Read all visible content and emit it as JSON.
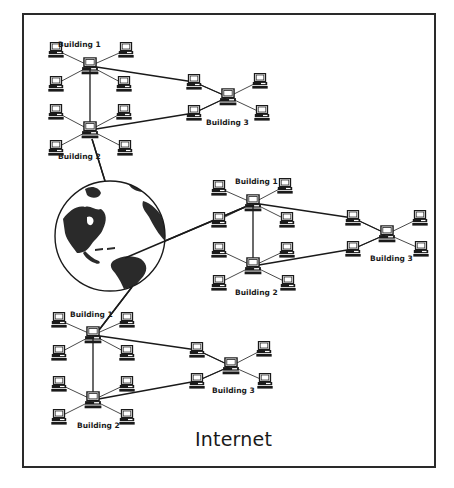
{
  "diagram": {
    "title": "Internet",
    "colors": {
      "ink": "#1a1a1a",
      "background": "#ffffff"
    },
    "globe": {
      "icon": "globe-icon",
      "cx": 110,
      "cy": 236,
      "r": 55
    },
    "networks": [
      {
        "id": "network-top-left",
        "buildings": [
          {
            "label": "Building 1",
            "hub": [
              90,
              66
            ],
            "label_pos": [
              58,
              47
            ],
            "satellites": [
              [
                56,
                50
              ],
              [
                126,
                50
              ],
              [
                56,
                84
              ],
              [
                124,
                84
              ]
            ]
          },
          {
            "label": "Building 2",
            "hub": [
              90,
              130
            ],
            "label_pos": [
              58,
              159
            ],
            "satellites": [
              [
                56,
                112
              ],
              [
                124,
                112
              ],
              [
                56,
                148
              ],
              [
                125,
                148
              ]
            ]
          },
          {
            "label": "Building 3",
            "hub": [
              228,
              97
            ],
            "label_pos": [
              206,
              125
            ],
            "satellites": [
              [
                194,
                82
              ],
              [
                260,
                81
              ],
              [
                194,
                113
              ],
              [
                262,
                113
              ]
            ]
          }
        ]
      },
      {
        "id": "network-middle-right",
        "buildings": [
          {
            "label": "Building 1",
            "hub": [
              253,
              203
            ],
            "label_pos": [
              235,
              184
            ],
            "satellites": [
              [
                219,
                188
              ],
              [
                285,
                186
              ],
              [
                219,
                220
              ],
              [
                287,
                220
              ]
            ]
          },
          {
            "label": "Building 2",
            "hub": [
              253,
              266
            ],
            "label_pos": [
              235,
              295
            ],
            "satellites": [
              [
                219,
                250
              ],
              [
                287,
                250
              ],
              [
                219,
                283
              ],
              [
                288,
                283
              ]
            ]
          },
          {
            "label": "Building 3",
            "hub": [
              387,
              234
            ],
            "label_pos": [
              370,
              261
            ],
            "satellites": [
              [
                353,
                218
              ],
              [
                420,
                218
              ],
              [
                353,
                249
              ],
              [
                421,
                249
              ]
            ]
          }
        ]
      },
      {
        "id": "network-bottom-left",
        "buildings": [
          {
            "label": "Building 1",
            "hub": [
              93,
              335
            ],
            "label_pos": [
              70,
              317
            ],
            "satellites": [
              [
                59,
                320
              ],
              [
                127,
                320
              ],
              [
                59,
                353
              ],
              [
                127,
                353
              ]
            ]
          },
          {
            "label": "Building 2",
            "hub": [
              93,
              400
            ],
            "label_pos": [
              77,
              428
            ],
            "satellites": [
              [
                59,
                384
              ],
              [
                127,
                384
              ],
              [
                59,
                417
              ],
              [
                127,
                417
              ]
            ]
          },
          {
            "label": "Building 3",
            "hub": [
              231,
              366
            ],
            "label_pos": [
              212,
              393
            ],
            "satellites": [
              [
                197,
                350
              ],
              [
                264,
                349
              ],
              [
                197,
                381
              ],
              [
                265,
                381
              ]
            ]
          }
        ]
      }
    ],
    "internet_links": [
      {
        "from": "globe",
        "to": "network-top-left.Building 2",
        "points": [
          [
            105,
            181
          ],
          [
            92,
            139
          ]
        ]
      },
      {
        "from": "globe",
        "to": "network-middle-right.Building 1",
        "points": [
          [
            125,
            258
          ],
          [
            245,
            207
          ]
        ]
      },
      {
        "from": "globe",
        "to": "network-bottom-left.Building 1",
        "points": [
          [
            132,
            287
          ],
          [
            99,
            330
          ]
        ]
      }
    ]
  }
}
